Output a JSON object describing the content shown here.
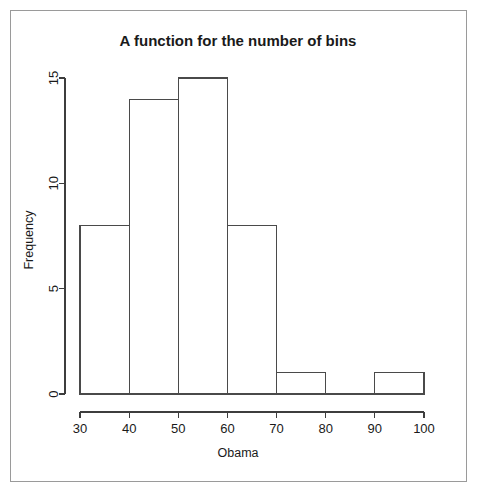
{
  "chart_data": {
    "type": "bar",
    "title": "A function for the number of bins",
    "xlabel": "Obama",
    "ylabel": "Frequency",
    "categories": [
      "30-40",
      "40-50",
      "50-60",
      "60-70",
      "70-80",
      "80-90",
      "90-100"
    ],
    "bin_edges": [
      30,
      40,
      50,
      60,
      70,
      80,
      90,
      100
    ],
    "values": [
      8,
      14,
      15,
      8,
      1,
      0,
      1
    ],
    "xlim": [
      30,
      100
    ],
    "ylim": [
      0,
      15
    ],
    "xticks": [
      30,
      40,
      50,
      60,
      70,
      80,
      90,
      100
    ],
    "xtick_labels": [
      "30",
      "40",
      "50",
      "60",
      "70",
      "80",
      "90",
      "100"
    ],
    "yticks": [
      0,
      5,
      10,
      15
    ],
    "ytick_labels": [
      "0",
      "5",
      "10",
      "15"
    ],
    "grid": false,
    "legend": false,
    "legend_position": "none",
    "bar_fill": "none",
    "bar_stroke": "#4a4a4a",
    "background": "#ffffff",
    "frame_border_color": "#9a9a9a"
  },
  "figure": {
    "title": "A function for the number of bins",
    "xlabel": "Obama",
    "ylabel": "Frequency",
    "xtick_labels": [
      "30",
      "40",
      "50",
      "60",
      "70",
      "80",
      "90",
      "100"
    ],
    "ytick_labels": [
      "0",
      "5",
      "10",
      "15"
    ]
  }
}
